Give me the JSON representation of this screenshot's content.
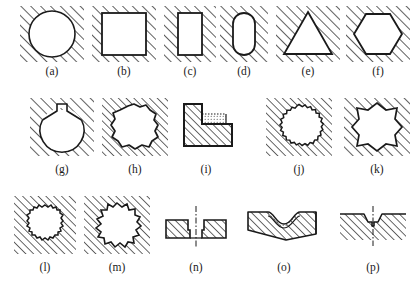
{
  "figure": {
    "title_partial": "",
    "background_color": "#ffffff",
    "line_color": "#1a1a1a",
    "hatch_color": "#2a2a2a",
    "width": 416,
    "height": 297,
    "rows": 3,
    "specimen_count": 16
  },
  "specimens": [
    {
      "id": "a",
      "label": "(a)",
      "shape_name": "circle-hole",
      "description": "Circular hole in hatched material",
      "row": 1,
      "x": 20,
      "y": 6,
      "w": 64,
      "h": 56,
      "caption_x": 20,
      "caption_y": 66,
      "caption_w": 64
    },
    {
      "id": "b",
      "label": "(b)",
      "shape_name": "square-hole",
      "description": "Square hole in hatched material",
      "row": 1,
      "x": 92,
      "y": 6,
      "w": 64,
      "h": 56,
      "caption_x": 92,
      "caption_y": 66,
      "caption_w": 64
    },
    {
      "id": "c",
      "label": "(c)",
      "shape_name": "rectangle-hole",
      "description": "Tall rectangular hole in hatched material",
      "row": 1,
      "x": 164,
      "y": 6,
      "w": 52,
      "h": 56,
      "caption_x": 164,
      "caption_y": 66,
      "caption_w": 52
    },
    {
      "id": "d",
      "label": "(d)",
      "shape_name": "rounded-rectangle-hole",
      "description": "Rounded-end slot hole in hatched material",
      "row": 1,
      "x": 220,
      "y": 6,
      "w": 48,
      "h": 56,
      "caption_x": 220,
      "caption_y": 66,
      "caption_w": 48
    },
    {
      "id": "e",
      "label": "(e)",
      "shape_name": "triangle-hole",
      "description": "Triangular hole in hatched material",
      "row": 1,
      "x": 276,
      "y": 6,
      "w": 64,
      "h": 56,
      "caption_x": 276,
      "caption_y": 66,
      "caption_w": 64
    },
    {
      "id": "f",
      "label": "(f)",
      "shape_name": "hexagon-hole",
      "description": "Hexagonal hole in hatched material",
      "row": 1,
      "x": 346,
      "y": 6,
      "w": 64,
      "h": 56,
      "caption_x": 346,
      "caption_y": 66,
      "caption_w": 64
    },
    {
      "id": "g",
      "label": "(g)",
      "shape_name": "circle-with-keyway-hole",
      "description": "Circular hole with small rectangular keyway notch at top",
      "row": 2,
      "x": 30,
      "y": 98,
      "w": 64,
      "h": 58,
      "caption_x": 30,
      "caption_y": 164,
      "caption_w": 64
    },
    {
      "id": "h",
      "label": "(h)",
      "shape_name": "irregular-polygon-hole",
      "description": "Irregular rough-edged polygonal hole",
      "row": 2,
      "x": 102,
      "y": 98,
      "w": 66,
      "h": 58,
      "caption_x": 102,
      "caption_y": 164,
      "caption_w": 66
    },
    {
      "id": "i",
      "label": "(i)",
      "shape_name": "l-shaped-section",
      "description": "L-shaped hatched solid section with stippled inner corner",
      "row": 2,
      "x": 180,
      "y": 100,
      "w": 60,
      "h": 52,
      "caption_x": 176,
      "caption_y": 164,
      "caption_w": 60
    },
    {
      "id": "j",
      "label": "(j)",
      "shape_name": "fine-serrated-circular-hole",
      "description": "Circular hole with fine serrated/knurled edge",
      "row": 2,
      "x": 266,
      "y": 98,
      "w": 66,
      "h": 58,
      "caption_x": 266,
      "caption_y": 164,
      "caption_w": 66
    },
    {
      "id": "k",
      "label": "(k)",
      "shape_name": "eight-point-star-hole",
      "description": "Eight-pointed star-shaped hole",
      "row": 2,
      "x": 344,
      "y": 98,
      "w": 66,
      "h": 58,
      "caption_x": 344,
      "caption_y": 164,
      "caption_w": 66
    },
    {
      "id": "l",
      "label": "(l)",
      "shape_name": "gear-tooth-hole-fine",
      "description": "Circular hole with fine gear-tooth edge",
      "row": 3,
      "x": 14,
      "y": 196,
      "w": 62,
      "h": 58,
      "caption_x": 14,
      "caption_y": 262,
      "caption_w": 62
    },
    {
      "id": "m",
      "label": "(m)",
      "shape_name": "gear-tooth-hole-coarse",
      "description": "Circular hole with coarse gear-tooth edge",
      "row": 3,
      "x": 84,
      "y": 196,
      "w": 66,
      "h": 58,
      "caption_x": 84,
      "caption_y": 262,
      "caption_w": 66
    },
    {
      "id": "n",
      "label": "(n)",
      "shape_name": "symmetric-groove-section",
      "description": "Symmetric T-slot groove cross-section with centerline",
      "row": 3,
      "x": 160,
      "y": 198,
      "w": 72,
      "h": 56,
      "caption_x": 160,
      "caption_y": 262,
      "caption_w": 72
    },
    {
      "id": "o",
      "label": "(o)",
      "shape_name": "curved-groove-section",
      "description": "Curved concave groove cross-section with stippled surface",
      "row": 3,
      "x": 246,
      "y": 200,
      "w": 76,
      "h": 50,
      "caption_x": 246,
      "caption_y": 262,
      "caption_w": 76
    },
    {
      "id": "p",
      "label": "(p)",
      "shape_name": "vee-notch-section",
      "description": "Shallow vee notch cross-section with centerline",
      "row": 3,
      "x": 338,
      "y": 200,
      "w": 70,
      "h": 52,
      "caption_x": 338,
      "caption_y": 262,
      "caption_w": 70
    }
  ]
}
